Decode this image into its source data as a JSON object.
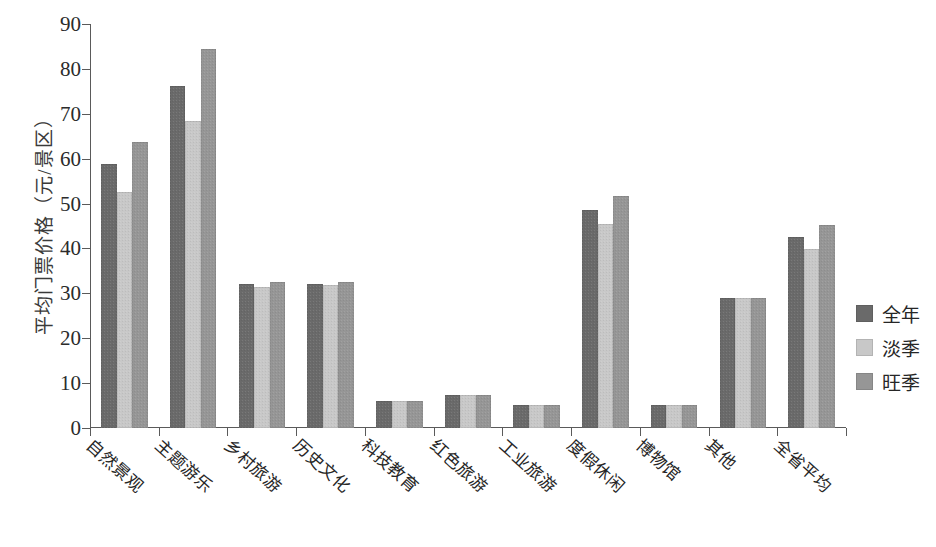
{
  "chart_data": {
    "type": "bar",
    "title": "",
    "xlabel": "",
    "ylabel": "平均门票价格（元/景区）",
    "ylim": [
      0,
      90
    ],
    "yticks": [
      0,
      10,
      20,
      30,
      40,
      50,
      60,
      70,
      80,
      90
    ],
    "grid": false,
    "legend_position": "right",
    "categories": [
      "自然景观",
      "主题游乐",
      "乡村旅游",
      "历史文化",
      "科技教育",
      "红色旅游",
      "工业旅游",
      "度假休闲",
      "博物馆",
      "其他",
      "全省平均"
    ],
    "series": [
      {
        "name": "全年",
        "color": "#6a6a6a",
        "values": [
          58.8,
          76.2,
          32.0,
          32.0,
          6.1,
          7.4,
          5.2,
          48.6,
          5.2,
          28.9,
          42.6
        ]
      },
      {
        "name": "淡季",
        "color": "#c8c8c8",
        "values": [
          52.6,
          68.5,
          31.5,
          31.9,
          6.1,
          7.4,
          5.2,
          45.5,
          5.2,
          28.9,
          39.8
        ]
      },
      {
        "name": "旺季",
        "color": "#969696",
        "values": [
          63.8,
          84.4,
          32.6,
          32.6,
          6.1,
          7.4,
          5.2,
          51.6,
          5.2,
          28.9,
          45.2
        ]
      }
    ]
  },
  "axis": {
    "y_tick_labels": [
      "0",
      "10",
      "20",
      "30",
      "40",
      "50",
      "60",
      "70",
      "80",
      "90"
    ]
  }
}
